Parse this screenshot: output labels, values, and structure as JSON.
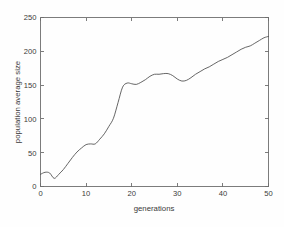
{
  "chart_data": {
    "type": "line",
    "title": "",
    "xlabel": "generations",
    "ylabel": "population average size",
    "xlim": [
      0,
      50
    ],
    "ylim": [
      0,
      250
    ],
    "xticks": [
      0,
      10,
      20,
      30,
      40,
      50
    ],
    "yticks": [
      0,
      50,
      100,
      150,
      200,
      250
    ],
    "grid": false,
    "legend": false,
    "line_color": "#4a4a4a",
    "background_color": "#fefefe",
    "axis_color": "#6e6e6e",
    "series": [
      {
        "name": "population average size",
        "x": [
          0,
          1,
          2,
          3,
          4,
          5,
          6,
          7,
          8,
          9,
          10,
          11,
          12,
          13,
          14,
          15,
          16,
          17,
          18,
          19,
          20,
          21,
          22,
          23,
          24,
          25,
          26,
          27,
          28,
          29,
          30,
          31,
          32,
          33,
          34,
          35,
          36,
          37,
          38,
          39,
          40,
          41,
          42,
          43,
          44,
          45,
          46,
          47,
          48,
          49,
          50
        ],
        "values": [
          18,
          21,
          20,
          12,
          18,
          25,
          34,
          43,
          51,
          57,
          62,
          63,
          63,
          70,
          78,
          89,
          101,
          124,
          147,
          153,
          152,
          151,
          154,
          158,
          163,
          166,
          166,
          167,
          167,
          164,
          159,
          156,
          157,
          161,
          166,
          170,
          174,
          177,
          181,
          185,
          188,
          191,
          195,
          199,
          203,
          206,
          208,
          212,
          216,
          220,
          222
        ]
      }
    ]
  },
  "axis": {
    "ylabel_text": "population average size",
    "xlabel_text": "generations",
    "ytick_labels": [
      "0",
      "50",
      "100",
      "150",
      "200",
      "250"
    ],
    "xtick_labels": [
      "0",
      "10",
      "20",
      "30",
      "40",
      "50"
    ]
  }
}
